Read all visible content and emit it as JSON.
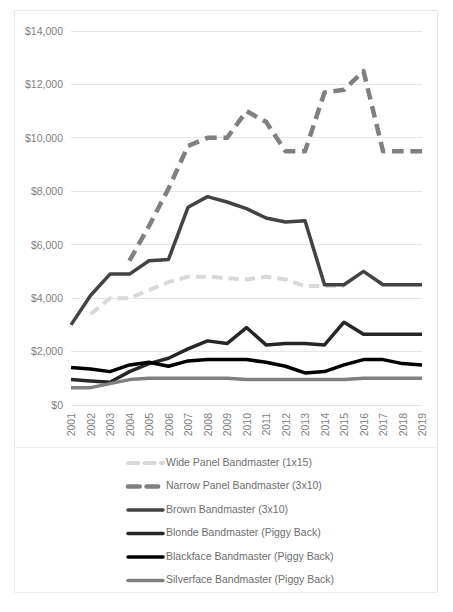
{
  "chart_data": {
    "type": "line",
    "title": "",
    "xlabel": "",
    "ylabel": "",
    "ylim": [
      0,
      14000
    ],
    "grid": true,
    "legend_position": "bottom",
    "y_ticks": [
      "$0",
      "$2,000",
      "$4,000",
      "$6,000",
      "$8,000",
      "$10,000",
      "$12,000",
      "$14,000"
    ],
    "y_tick_values": [
      0,
      2000,
      4000,
      6000,
      8000,
      10000,
      12000,
      14000
    ],
    "categories": [
      "2001",
      "2002",
      "2003",
      "2004",
      "2005",
      "2006",
      "2007",
      "2008",
      "2009",
      "2010",
      "2011",
      "2012",
      "2013",
      "2014",
      "2015",
      "2016",
      "2017",
      "2018",
      "2019"
    ],
    "series": [
      {
        "name": "Wide Panel Bandmaster (1x15)",
        "color": "#d9d9d9",
        "style": "dashed",
        "width": 4,
        "values": [
          null,
          3400,
          4000,
          4000,
          4300,
          4600,
          4800,
          4800,
          4750,
          4700,
          4800,
          4700,
          4450,
          4450,
          4450,
          null,
          null,
          null,
          null
        ]
      },
      {
        "name": "Narrow Panel Bandmaster (3x10)",
        "color": "#808080",
        "style": "dashed",
        "width": 4.5,
        "values": [
          null,
          null,
          null,
          5400,
          6700,
          8100,
          9700,
          10000,
          10000,
          11000,
          10600,
          9500,
          9500,
          11700,
          11800,
          12500,
          9500,
          9500,
          9500
        ]
      },
      {
        "name": "Brown Bandmaster (3x10)",
        "color": "#434343",
        "style": "solid",
        "width": 3.5,
        "values": [
          3000,
          4100,
          4900,
          4900,
          5400,
          5450,
          7400,
          7800,
          7600,
          7350,
          7000,
          6850,
          6900,
          4500,
          4500,
          5000,
          4500,
          4500,
          4500
        ]
      },
      {
        "name": "Blonde Bandmaster (Piggy Back)",
        "color": "#262626",
        "style": "solid",
        "width": 3.5,
        "values": [
          950,
          900,
          850,
          1250,
          1550,
          1750,
          2100,
          2400,
          2300,
          2900,
          2250,
          2300,
          2300,
          2250,
          3100,
          2650,
          2650,
          2650,
          2650
        ]
      },
      {
        "name": "Blackface Bandmaster (Piggy Back)",
        "color": "#000000",
        "style": "solid",
        "width": 3.5,
        "values": [
          1400,
          1350,
          1250,
          1500,
          1600,
          1450,
          1650,
          1700,
          1700,
          1700,
          1600,
          1450,
          1200,
          1250,
          1500,
          1700,
          1700,
          1550,
          1500
        ]
      },
      {
        "name": "Silverface Bandmaster (Piggy Back)",
        "color": "#808080",
        "style": "solid",
        "width": 3.5,
        "values": [
          650,
          650,
          800,
          950,
          1000,
          1000,
          1000,
          1000,
          1000,
          950,
          950,
          950,
          950,
          950,
          950,
          1000,
          1000,
          1000,
          1000
        ]
      }
    ]
  },
  "legend": {
    "entries": [
      "Wide Panel Bandmaster (1x15)",
      "Narrow Panel Bandmaster (3x10)",
      "Brown Bandmaster (3x10)",
      "Blonde Bandmaster (Piggy Back)",
      "Blackface Bandmaster (Piggy Back)",
      "Silverface Bandmaster (Piggy Back)"
    ]
  }
}
